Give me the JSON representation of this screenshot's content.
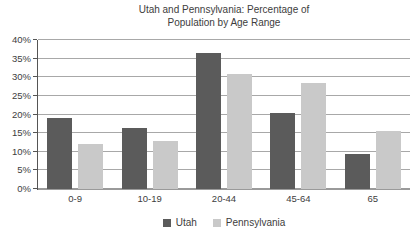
{
  "title_line1": "Utah and Pennsylvania: Percentage of",
  "title_line2": "Population by Age Range",
  "chart_data": {
    "type": "bar",
    "title": "Utah and Pennsylvania: Percentage of Population by Age Range",
    "categories": [
      "0-9",
      "10-19",
      "20-44",
      "45-64",
      "65"
    ],
    "series": [
      {
        "name": "Utah",
        "color": "#5b5b5b",
        "values": [
          19,
          16.5,
          36.5,
          20.5,
          9.5
        ]
      },
      {
        "name": "Pennsylvania",
        "color": "#c9c9c9",
        "values": [
          12,
          13,
          31,
          28.5,
          15.5
        ]
      }
    ],
    "xlabel": "",
    "ylabel": "",
    "ylim": [
      0,
      40
    ],
    "ytick_step": 5,
    "ytick_suffix": "%",
    "grid": true,
    "legend_position": "bottom"
  },
  "style_colors": {
    "gridline": "#a8a8a8",
    "baseline": "#9a9a9a",
    "y_axis": "#555555",
    "text": "#3d3d3d",
    "background": "#ffffff"
  }
}
